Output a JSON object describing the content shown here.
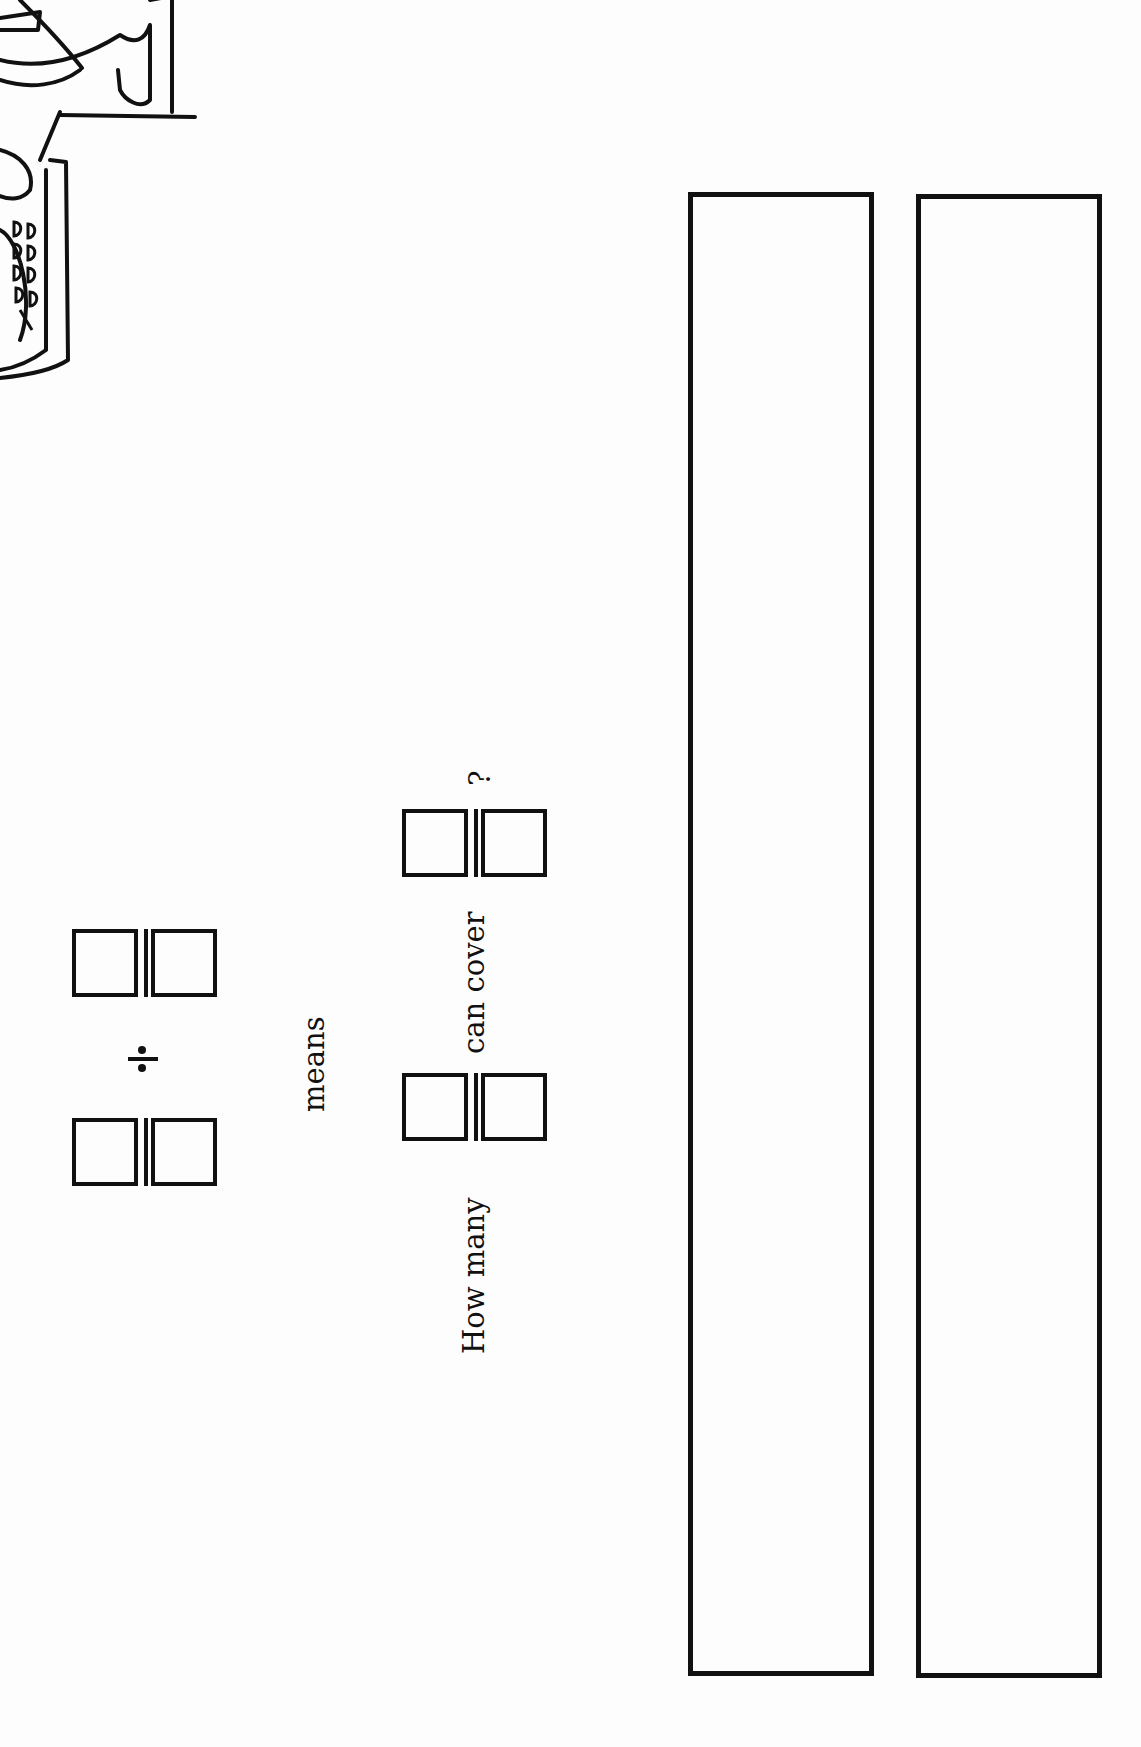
{
  "worksheet": {
    "orientation": "rotated-90-clockwise",
    "expression": {
      "dividend": {
        "numerator": "",
        "denominator": ""
      },
      "operator": "÷",
      "divisor": {
        "numerator": "",
        "denominator": ""
      }
    },
    "connector_text": "means",
    "question": {
      "prefix": "How many",
      "fraction_a": {
        "numerator": "",
        "denominator": ""
      },
      "middle": "can cover",
      "fraction_b": {
        "numerator": "",
        "denominator": ""
      },
      "suffix": "?"
    },
    "model_bars": [
      {
        "label": "",
        "content": ""
      },
      {
        "label": "",
        "content": ""
      }
    ],
    "illustration": "partial cartoon figure holding a tray (cropped)"
  }
}
